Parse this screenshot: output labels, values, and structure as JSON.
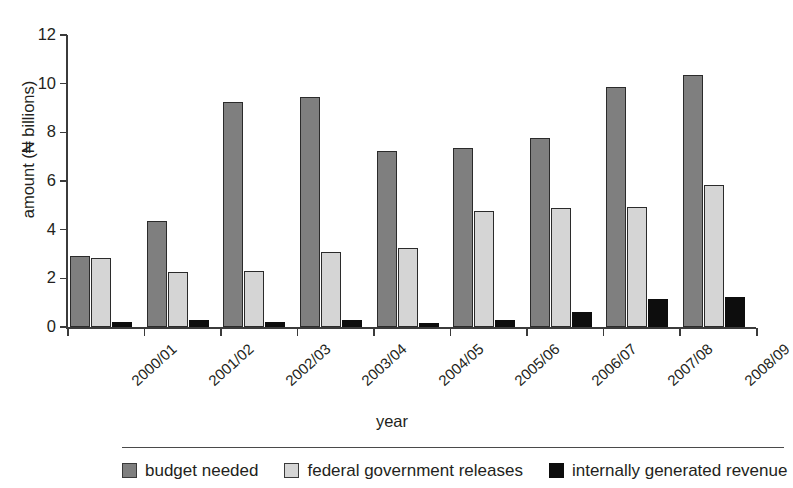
{
  "top_fragment": "",
  "chart_data": {
    "type": "bar",
    "title": "",
    "xlabel": "year",
    "ylabel": "amount (₦ billions)",
    "ylim": [
      0,
      12
    ],
    "yticks": [
      0,
      2,
      4,
      6,
      8,
      10,
      12
    ],
    "grid": false,
    "legend_position": "bottom",
    "categories": [
      "2000/01",
      "2001/02",
      "2002/03",
      "2003/04",
      "2004/05",
      "2005/06",
      "2006/07",
      "2007/08",
      "2008/09"
    ],
    "series": [
      {
        "name": "budget needed",
        "color": "#7f7f7f",
        "values": [
          2.9,
          4.35,
          9.25,
          9.45,
          7.25,
          7.35,
          7.75,
          9.85,
          10.35
        ]
      },
      {
        "name": "federal government releases",
        "color": "#d5d5d5",
        "values": [
          2.85,
          2.25,
          2.3,
          3.1,
          3.25,
          4.75,
          4.9,
          4.95,
          5.85
        ]
      },
      {
        "name": "internally generated revenue",
        "color": "#0d0d0d",
        "values": [
          0.22,
          0.3,
          0.2,
          0.3,
          0.15,
          0.28,
          0.6,
          1.15,
          1.22
        ]
      }
    ]
  }
}
